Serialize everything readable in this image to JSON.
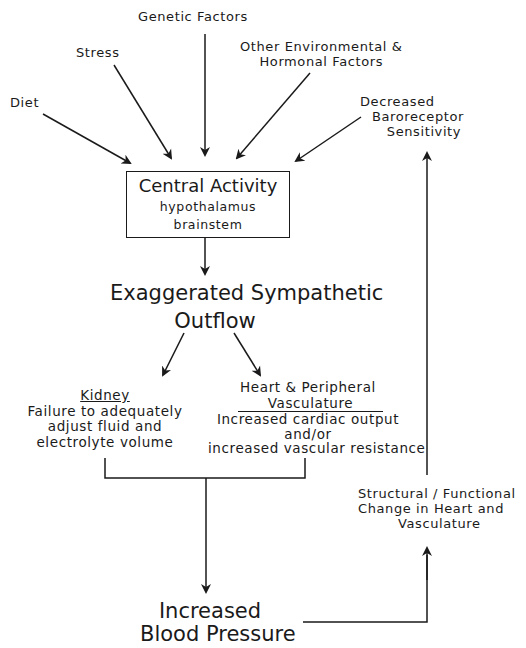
{
  "diagram": {
    "inputs": {
      "diet": "Diet",
      "stress": "Stress",
      "genetic": "Genetic Factors",
      "other_env": [
        "Other Environmental &",
        "Hormonal Factors"
      ],
      "baroreceptor": [
        "Decreased",
        "Baroreceptor",
        "Sensitivity"
      ]
    },
    "central": {
      "title": "Central Activity",
      "sub1": "hypothalamus",
      "sub2": "brainstem"
    },
    "sympathetic": [
      "Exaggerated Sympathetic",
      "Outflow"
    ],
    "kidney": {
      "heading": "Kidney",
      "lines": [
        "Failure to adequately",
        "adjust fluid and",
        "electrolyte volume"
      ]
    },
    "heart": {
      "heading": [
        "Heart & Peripheral",
        "Vasculature"
      ],
      "lines": [
        "Increased cardiac output",
        "and/or",
        "increased vascular resistance"
      ]
    },
    "structural": [
      "Structural / Functional",
      "Change in Heart and",
      "Vasculature"
    ],
    "outcome": [
      "Increased",
      "Blood Pressure"
    ],
    "line_color": "#1a1a1a"
  }
}
